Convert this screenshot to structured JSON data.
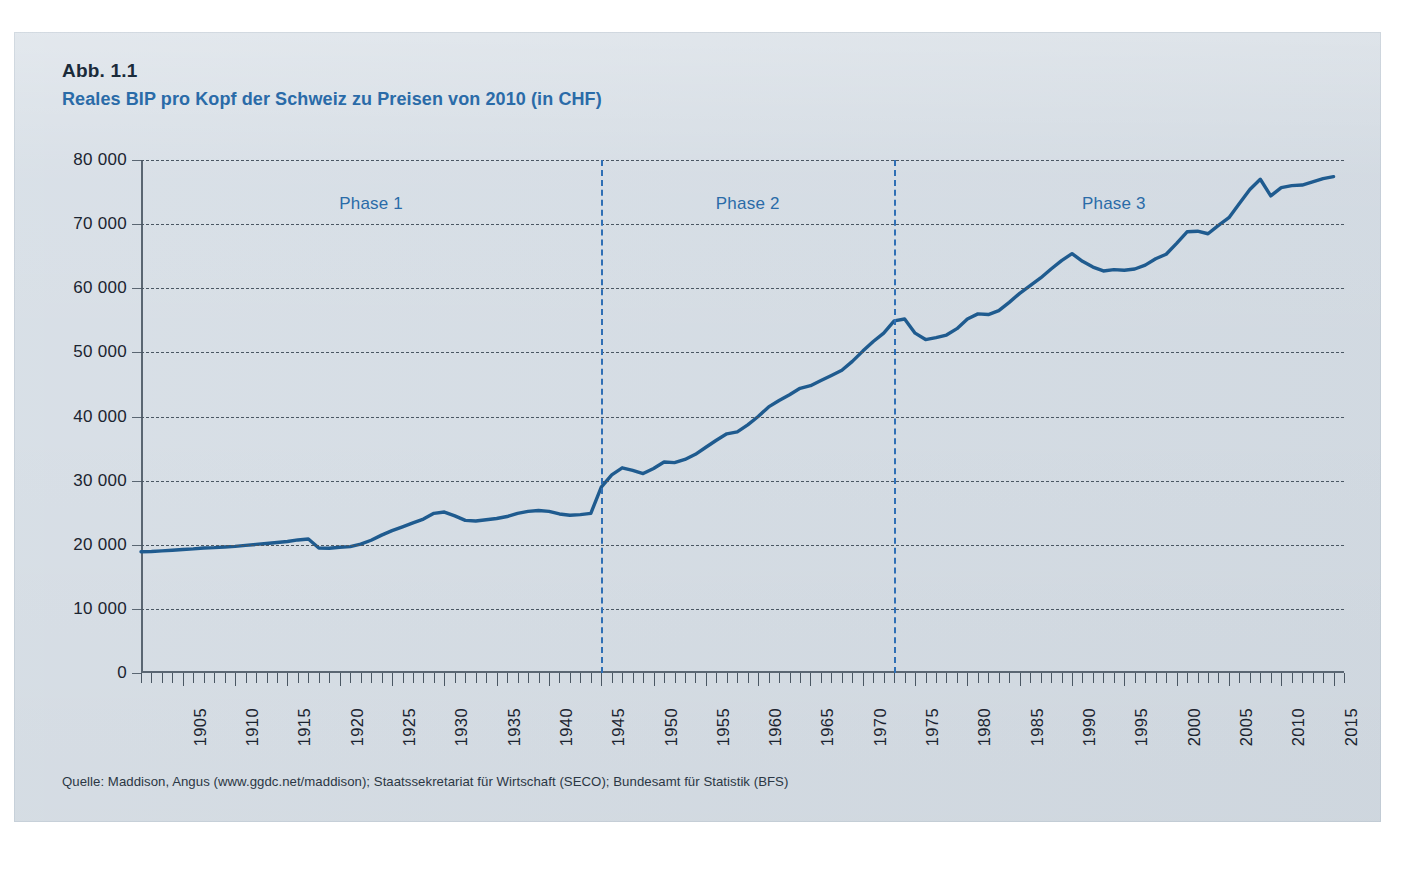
{
  "figure": {
    "number": "Abb. 1.1",
    "title": "Reales BIP pro Kopf der Schweiz zu Preisen von 2010 (in CHF)",
    "source": "Quelle: Maddison, Angus (www.ggdc.net/maddison); Staatssekretariat für Wirtschaft (SECO); Bundesamt für Statistik (BFS)"
  },
  "colors": {
    "panel_background": "#d4dce4",
    "title_blue": "#2a6ba8",
    "series_line": "#1f5b8f",
    "gridline": "#4a5763",
    "divider": "#2f6fb5",
    "axis": "#5a6672",
    "text_dark": "#1b2430"
  },
  "chart_data": {
    "type": "line",
    "title": "Reales BIP pro Kopf der Schweiz zu Preisen von 2010 (in CHF)",
    "xlabel": "",
    "ylabel": "",
    "xlim": [
      1901,
      2016
    ],
    "ylim": [
      0,
      80000
    ],
    "grid": true,
    "legend": "none",
    "ytick_labels": [
      "0",
      "10 000",
      "20 000",
      "30 000",
      "40 000",
      "50 000",
      "60 000",
      "70 000",
      "80 000"
    ],
    "ytick_values": [
      0,
      10000,
      20000,
      30000,
      40000,
      50000,
      60000,
      70000,
      80000
    ],
    "xtick_labels": [
      "1905",
      "1910",
      "1915",
      "1920",
      "1925",
      "1930",
      "1935",
      "1940",
      "1945",
      "1950",
      "1955",
      "1960",
      "1965",
      "1970",
      "1975",
      "1980",
      "1985",
      "1990",
      "1995",
      "2000",
      "2005",
      "2010",
      "2015"
    ],
    "xtick_values": [
      1905,
      1910,
      1915,
      1920,
      1925,
      1930,
      1935,
      1940,
      1945,
      1950,
      1955,
      1960,
      1965,
      1970,
      1975,
      1980,
      1985,
      1990,
      1995,
      2000,
      2005,
      2010,
      2015
    ],
    "xtick_minor_step": 1,
    "annotations": [
      {
        "label": "Phase 1",
        "type": "region-label",
        "x": 1923,
        "y": 73000
      },
      {
        "label": "Phase 2",
        "type": "region-label",
        "x": 1959,
        "y": 73000
      },
      {
        "label": "Phase 3",
        "type": "region-label",
        "x": 1994,
        "y": 73000
      }
    ],
    "vertical_dividers": [
      {
        "x": 1945,
        "style": "dashed",
        "color": "#2f6fb5"
      },
      {
        "x": 1973,
        "style": "dashed",
        "color": "#2f6fb5"
      }
    ],
    "series": [
      {
        "name": "Reales BIP pro Kopf (CHF, Preise von 2010)",
        "color": "#1f5b8f",
        "x": [
          1901,
          1902,
          1903,
          1904,
          1905,
          1906,
          1907,
          1908,
          1909,
          1910,
          1911,
          1912,
          1913,
          1914,
          1915,
          1916,
          1917,
          1918,
          1919,
          1920,
          1921,
          1922,
          1923,
          1924,
          1925,
          1926,
          1927,
          1928,
          1929,
          1930,
          1931,
          1932,
          1933,
          1934,
          1935,
          1936,
          1937,
          1938,
          1939,
          1940,
          1941,
          1942,
          1943,
          1944,
          1945,
          1946,
          1947,
          1948,
          1949,
          1950,
          1951,
          1952,
          1953,
          1954,
          1955,
          1956,
          1957,
          1958,
          1959,
          1960,
          1961,
          1962,
          1963,
          1964,
          1965,
          1966,
          1967,
          1968,
          1969,
          1970,
          1971,
          1972,
          1973,
          1974,
          1975,
          1976,
          1977,
          1978,
          1979,
          1980,
          1981,
          1982,
          1983,
          1984,
          1985,
          1986,
          1987,
          1988,
          1989,
          1990,
          1991,
          1992,
          1993,
          1994,
          1995,
          1996,
          1997,
          1998,
          1999,
          2000,
          2001,
          2002,
          2003,
          2004,
          2005,
          2006,
          2007,
          2008,
          2009,
          2010,
          2011,
          2012,
          2013,
          2014,
          2015
        ],
        "values": [
          18900,
          18950,
          19050,
          19150,
          19250,
          19350,
          19500,
          19550,
          19650,
          19750,
          19900,
          20050,
          20200,
          20350,
          20500,
          20750,
          20900,
          19500,
          19450,
          19600,
          19700,
          20100,
          20700,
          21500,
          22200,
          22800,
          23400,
          24000,
          24900,
          25100,
          24500,
          23800,
          23700,
          23900,
          24100,
          24400,
          24900,
          25200,
          25350,
          25200,
          24800,
          24600,
          24700,
          24900,
          29000,
          30900,
          32000,
          31600,
          31100,
          31900,
          32900,
          32800,
          33300,
          34100,
          35200,
          36300,
          37300,
          37600,
          38700,
          40000,
          41500,
          42500,
          43400,
          44400,
          44800,
          45600,
          46400,
          47200,
          48600,
          50200,
          51700,
          53000,
          54900,
          55200,
          53000,
          52000,
          52300,
          52700,
          53700,
          55200,
          56000,
          55900,
          56500,
          57800,
          59200,
          60400,
          61600,
          63000,
          64300,
          65400,
          64200,
          63300,
          62700,
          62900,
          62800,
          63000,
          63600,
          64600,
          65300,
          67000,
          68800,
          68900,
          68500,
          69800,
          71000,
          73200,
          75400,
          77000,
          74400,
          75700,
          76000,
          76100,
          76600,
          77100,
          77400
        ]
      }
    ]
  }
}
